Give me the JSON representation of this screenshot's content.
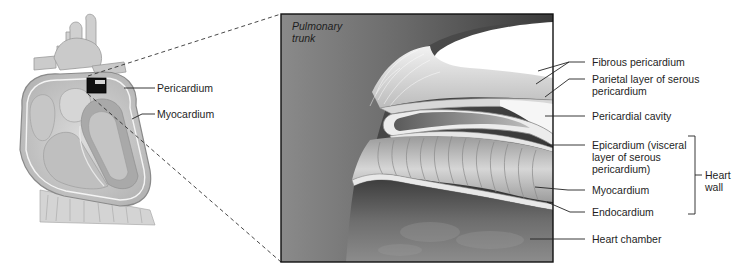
{
  "figure": {
    "overview": {
      "subject": "heart-cross-section",
      "labels": [
        {
          "id": "pericardium",
          "text": "Pericardium"
        },
        {
          "id": "myocardium",
          "text": "Myocardium"
        }
      ]
    },
    "inset": {
      "corner_label_line1": "Pulmonary",
      "corner_label_line2": "trunk",
      "labels": [
        {
          "id": "fibrous-pericardium",
          "lines": [
            "Fibrous pericardium"
          ]
        },
        {
          "id": "parietal-layer",
          "lines": [
            "Parietal layer of serous",
            "pericardium"
          ]
        },
        {
          "id": "pericardial-cavity",
          "lines": [
            "Pericardial cavity"
          ]
        },
        {
          "id": "epicardium",
          "lines": [
            "Epicardium (visceral",
            "layer of serous",
            "pericardium)"
          ]
        },
        {
          "id": "myocardium",
          "lines": [
            "Myocardium"
          ]
        },
        {
          "id": "endocardium",
          "lines": [
            "Endocardium"
          ]
        },
        {
          "id": "heart-chamber",
          "lines": [
            "Heart chamber"
          ]
        }
      ],
      "bracket": {
        "lines": [
          "Heart",
          "wall"
        ]
      }
    }
  }
}
